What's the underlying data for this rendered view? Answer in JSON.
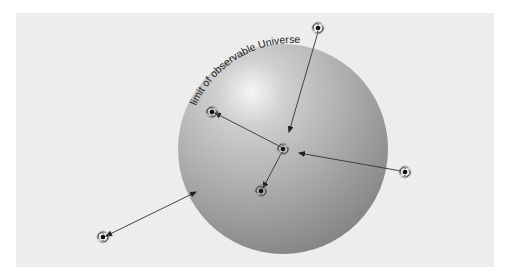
{
  "diagram": {
    "label": "limit of observable Universe",
    "colors": {
      "background": "#ededed",
      "sphere_light": "#f4f4f4",
      "sphere_mid": "#b5b5b5",
      "sphere_dark": "#7c7c7c",
      "line": "#333333"
    },
    "sphere": {
      "cx": 283,
      "cy": 149,
      "r": 105
    },
    "galaxies": [
      {
        "id": "observer",
        "x": 283,
        "y": 149
      },
      {
        "id": "top",
        "x": 318,
        "y": 28
      },
      {
        "id": "upper-left",
        "x": 212,
        "y": 112
      },
      {
        "id": "lower",
        "x": 261,
        "y": 191
      },
      {
        "id": "right",
        "x": 405,
        "y": 172
      },
      {
        "id": "lower-left",
        "x": 103,
        "y": 237
      }
    ],
    "arrows": [
      {
        "from": "top",
        "x1": 318,
        "y1": 32,
        "x2": 289,
        "y2": 132,
        "description": "light from beyond limit, arrowhead inside sphere"
      },
      {
        "from": "right",
        "x1": 401,
        "y1": 171,
        "x2": 299,
        "y2": 153,
        "description": "light from beyond limit, arrowhead inside sphere"
      },
      {
        "from": "observer",
        "x1": 281,
        "y1": 147,
        "x2": 215,
        "y2": 113,
        "description": "to upper-left galaxy"
      },
      {
        "from": "observer",
        "x1": 282,
        "y1": 152,
        "x2": 263,
        "y2": 188,
        "description": "to lower galaxy"
      },
      {
        "from": "lower-left",
        "x1": 106,
        "y1": 236,
        "x2": 196,
        "y2": 192,
        "description": "double-ended arrow to sphere edge"
      }
    ]
  }
}
